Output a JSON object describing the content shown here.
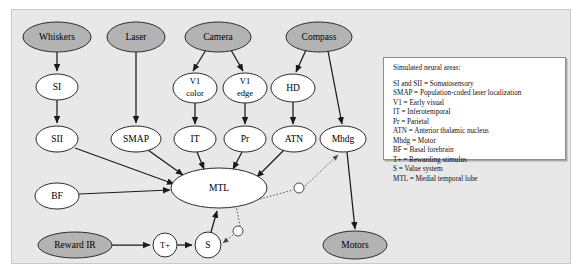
{
  "figure": {
    "background_color": "#e8e8e8",
    "input_node_color": "#b3b3b3",
    "neural_node_color": "#ffffff",
    "edge_color": "#1a1a1a"
  },
  "nodes": {
    "whiskers": {
      "label": "Whiskers",
      "type": "input",
      "cx": 57,
      "cy": 37,
      "rx": 34,
      "ry": 15
    },
    "laser": {
      "label": "Laser",
      "type": "input",
      "cx": 136,
      "cy": 37,
      "rx": 29,
      "ry": 15
    },
    "camera": {
      "label": "Camera",
      "type": "input",
      "cx": 218,
      "cy": 37,
      "rx": 33,
      "ry": 15
    },
    "compass": {
      "label": "Compass",
      "type": "input",
      "cx": 319,
      "cy": 37,
      "rx": 33,
      "ry": 15
    },
    "si": {
      "label": "SI",
      "type": "neural",
      "cx": 57,
      "cy": 87,
      "rx": 21,
      "ry": 13
    },
    "v1color_line1": "V1",
    "v1color_line2": "color",
    "v1edge_line1": "V1",
    "v1edge_line2": "edge",
    "v1color": {
      "label": "V1 color",
      "type": "neural",
      "cx": 195,
      "cy": 88,
      "rx": 22,
      "ry": 15
    },
    "v1edge": {
      "label": "V1 edge",
      "type": "neural",
      "cx": 245,
      "cy": 88,
      "rx": 22,
      "ry": 15
    },
    "hd": {
      "label": "HD",
      "type": "neural",
      "cx": 293,
      "cy": 88,
      "rx": 22,
      "ry": 14
    },
    "sii": {
      "label": "SII",
      "type": "neural",
      "cx": 57,
      "cy": 139,
      "rx": 21,
      "ry": 13
    },
    "smap": {
      "label": "SMAP",
      "type": "neural",
      "cx": 136,
      "cy": 139,
      "rx": 25,
      "ry": 13
    },
    "it": {
      "label": "IT",
      "type": "neural",
      "cx": 195,
      "cy": 139,
      "rx": 21,
      "ry": 13
    },
    "pr": {
      "label": "Pr",
      "type": "neural",
      "cx": 245,
      "cy": 139,
      "rx": 21,
      "ry": 13
    },
    "atn": {
      "label": "ATN",
      "type": "neural",
      "cx": 294,
      "cy": 139,
      "rx": 22,
      "ry": 13
    },
    "mhdg": {
      "label": "Mhdg",
      "type": "neural",
      "cx": 343,
      "cy": 139,
      "rx": 23,
      "ry": 13
    },
    "bf": {
      "label": "BF",
      "type": "neural",
      "cx": 57,
      "cy": 196,
      "rx": 22,
      "ry": 13
    },
    "mtl": {
      "label": "MTL",
      "type": "neural",
      "cx": 219,
      "cy": 188,
      "rx": 48,
      "ry": 20
    },
    "reward_ir": {
      "label": "Reward IR",
      "type": "input",
      "cx": 75,
      "cy": 245,
      "rx": 37,
      "ry": 13
    },
    "tplus": {
      "label": "T+",
      "type": "neural",
      "cx": 165,
      "cy": 245,
      "rx": 12,
      "ry": 12
    },
    "s": {
      "label": "S",
      "type": "neural",
      "cx": 208,
      "cy": 245,
      "rx": 13,
      "ry": 13
    },
    "motors": {
      "label": "Motors",
      "type": "input",
      "cx": 355,
      "cy": 245,
      "rx": 32,
      "ry": 14
    }
  },
  "edges": [
    {
      "from": "whiskers",
      "to": "si"
    },
    {
      "from": "si",
      "to": "sii"
    },
    {
      "from": "laser",
      "to": "smap"
    },
    {
      "from": "camera",
      "to": "v1color"
    },
    {
      "from": "camera",
      "to": "v1edge"
    },
    {
      "from": "v1color",
      "to": "it"
    },
    {
      "from": "v1edge",
      "to": "pr"
    },
    {
      "from": "compass",
      "to": "hd"
    },
    {
      "from": "compass",
      "to": "mhdg"
    },
    {
      "from": "hd",
      "to": "atn"
    },
    {
      "from": "sii",
      "to": "mtl"
    },
    {
      "from": "smap",
      "to": "mtl"
    },
    {
      "from": "it",
      "to": "mtl"
    },
    {
      "from": "pr",
      "to": "mtl"
    },
    {
      "from": "atn",
      "to": "mtl"
    },
    {
      "from": "bf",
      "to": "mtl"
    },
    {
      "from": "reward_ir",
      "to": "tplus"
    },
    {
      "from": "tplus",
      "to": "s"
    },
    {
      "from": "s",
      "to": "mtl"
    },
    {
      "from": "mhdg",
      "to": "motors"
    }
  ],
  "modulatory_edges": [
    {
      "from": "mtl",
      "to": "mhdg",
      "marker": "open-circle"
    },
    {
      "from": "mtl",
      "to": "s",
      "marker": "open-circle"
    }
  ],
  "legend": {
    "title": "Simulated neural areas:",
    "lines": [
      "SI and SII = Somatosensory",
      "SMAP = Population-coded laser localization",
      "V1 = Early visual",
      "IT = Inferotemporal",
      "Pr = Parietal",
      "ATN = Anterior thalamic nucleus",
      "Mhdg = Motor",
      "BF = Basal forebrain",
      "T+ = Rewarding stimulus",
      "S = Value system",
      "MTL = Medial temporal lobe"
    ]
  }
}
